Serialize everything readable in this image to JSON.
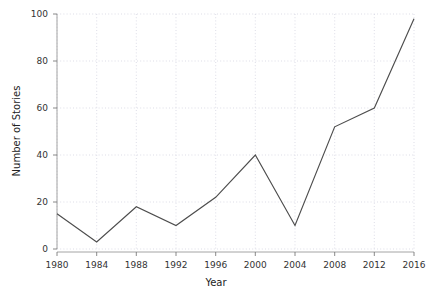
{
  "chart_data": {
    "type": "line",
    "title": "",
    "xlabel": "Year",
    "ylabel": "Number of Stories",
    "x": [
      1980,
      1984,
      1988,
      1992,
      1996,
      2000,
      2004,
      2008,
      2012,
      2016
    ],
    "values": [
      15,
      3,
      18,
      10,
      22,
      40,
      10,
      52,
      60,
      98
    ],
    "series": [
      {
        "name": "Number of Stories",
        "values": [
          15,
          3,
          18,
          10,
          22,
          40,
          10,
          52,
          60,
          98
        ],
        "color": "#4d4d4d"
      }
    ],
    "xticks": [
      "1980",
      "1984",
      "1988",
      "1992",
      "1996",
      "2000",
      "2004",
      "2008",
      "2012",
      "2016"
    ],
    "yticks": [
      "0",
      "20",
      "40",
      "60",
      "80",
      "100"
    ],
    "ytick_values": [
      0,
      20,
      40,
      60,
      80,
      100
    ],
    "xlim": [
      1980,
      2016
    ],
    "ylim": [
      0,
      100
    ],
    "grid": true,
    "grid_color": "#cfcfdd",
    "legend": "none",
    "line_color": "#4d4d4d",
    "background": "#ffffff"
  },
  "axes": {
    "x_title": "Year",
    "y_title": "Number of Stories"
  }
}
